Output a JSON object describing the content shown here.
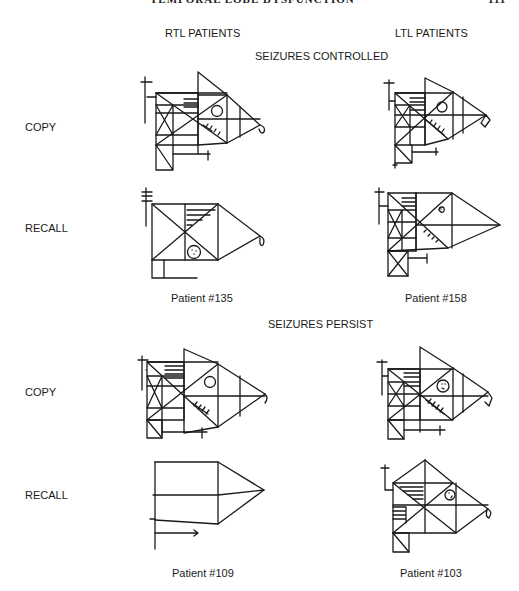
{
  "page_header": {
    "running_title": "TEMPORAL LOBE DYSFUNCTION",
    "page_number": "111"
  },
  "columns": [
    {
      "label": "RTL PATIENTS"
    },
    {
      "label": "LTL PATIENTS"
    }
  ],
  "sections": [
    {
      "title": "SEIZURES CONTROLLED",
      "rows": [
        {
          "label": "COPY"
        },
        {
          "label": "RECALL"
        }
      ],
      "captions": [
        "Patient #135",
        "Patient #158"
      ]
    },
    {
      "title": "SEIZURES PERSIST",
      "rows": [
        {
          "label": "COPY"
        },
        {
          "label": "RECALL"
        }
      ],
      "captions": [
        "Patient #109",
        "Patient #103"
      ]
    }
  ],
  "figures": [
    {
      "id": "rtl-controlled-copy",
      "desc": "Rey complex figure copy drawing"
    },
    {
      "id": "ltl-controlled-copy",
      "desc": "Rey complex figure copy drawing"
    },
    {
      "id": "rtl-controlled-recall",
      "desc": "Rey complex figure recall drawing"
    },
    {
      "id": "ltl-controlled-recall",
      "desc": "Rey complex figure recall drawing"
    },
    {
      "id": "rtl-persist-copy",
      "desc": "Rey complex figure copy drawing"
    },
    {
      "id": "ltl-persist-copy",
      "desc": "Rey complex figure copy drawing"
    },
    {
      "id": "rtl-persist-recall",
      "desc": "Rey complex figure recall drawing (simplified outline)"
    },
    {
      "id": "ltl-persist-recall",
      "desc": "Rey complex figure recall drawing"
    }
  ]
}
